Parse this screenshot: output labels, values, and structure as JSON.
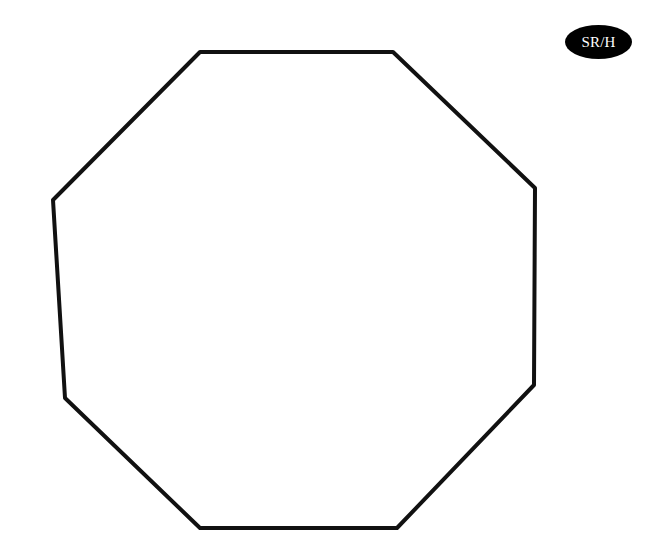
{
  "badge": {
    "label": "SR/H",
    "background": "#000000",
    "text_color": "#ffffff"
  },
  "shape": {
    "type": "octagon",
    "stroke": "#111111",
    "stroke_width": 4,
    "fill": "#ffffff",
    "points": "200,52 393,52 535,188 534,385 397,528 200,528 65,398 53,200"
  }
}
